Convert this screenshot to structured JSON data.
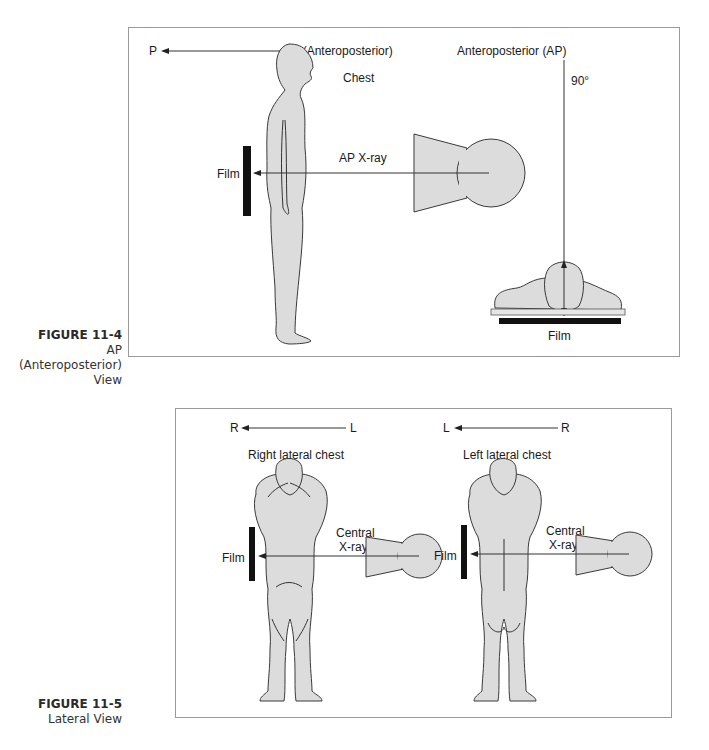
{
  "figures": [
    {
      "number": "FIGURE 11-4",
      "title": "AP (Anteroposterior) View",
      "title_line1": "AP (Anteroposterior)",
      "title_line2": "View",
      "labels": {
        "direction_from": "A (Anteroposterior)",
        "direction_to": "P",
        "view_name": "Anteroposterior (AP)",
        "angle": "90°",
        "body_part": "Chest",
        "beam": "AP X-ray",
        "film_left": "Film",
        "film_bottom": "Film"
      }
    },
    {
      "number": "FIGURE 11-5",
      "title": "Lateral View",
      "panels": [
        {
          "direction_to": "R",
          "direction_from": "L",
          "title": "Right lateral chest",
          "film": "Film",
          "beam_line1": "Central",
          "beam_line2": "X-ray"
        },
        {
          "direction_to": "L",
          "direction_from": "R",
          "title": "Left lateral chest",
          "film": "Film",
          "beam_line1": "Central",
          "beam_line2": "X-ray"
        }
      ]
    }
  ],
  "colors": {
    "body_fill": "#dcdcdc",
    "outline": "#3a3a3a",
    "film": "#111111",
    "frame": "#9a9a9a"
  }
}
